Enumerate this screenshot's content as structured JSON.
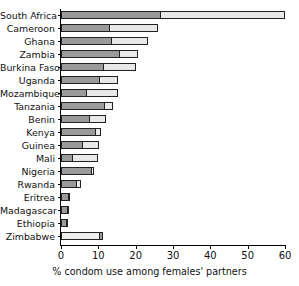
{
  "title_clipped": "condom use",
  "chart_data": {
    "type": "bar",
    "orientation": "horizontal",
    "stacked": true,
    "title": "",
    "xlabel": "% condom use among females' partners",
    "ylabel": "",
    "xlim": [
      0,
      60
    ],
    "xticks": [
      0,
      10,
      20,
      30,
      40,
      50,
      60
    ],
    "xticklabels": [
      "0",
      "10",
      "20",
      "30",
      "40",
      "50",
      "60"
    ],
    "grid": false,
    "legend": "none",
    "colors": {
      "segment_dark": "#9a9a9a",
      "segment_light": "#e8e8e8",
      "outline": "#222222",
      "background": "#ffffff"
    },
    "categories": [
      "South Africa",
      "Cameroon",
      "Ghana",
      "Zambia",
      "Burkina Faso",
      "Uganda",
      "Mozambique",
      "Tanzania",
      "Benin",
      "Kenya",
      "Guinea",
      "Mali",
      "Nigeria",
      "Rwanda",
      "Eritrea",
      "Madagascar",
      "Ethiopia",
      "Zimbabwe"
    ],
    "series": [
      {
        "name": "inner segment",
        "values": [
          26.3,
          12.6,
          13.2,
          15.3,
          11.0,
          10.0,
          6.5,
          11.3,
          7.3,
          8.9,
          5.4,
          2.7,
          7.9,
          3.7,
          1.6,
          1.4,
          1.0,
          10.0
        ]
      },
      {
        "name": "total",
        "values": [
          60.0,
          26.0,
          23.3,
          20.6,
          20.0,
          15.3,
          15.3,
          14.0,
          12.0,
          10.6,
          10.2,
          9.9,
          8.9,
          5.4,
          2.4,
          2.2,
          1.9,
          11.3
        ]
      }
    ],
    "zimbabwe_note": "light segment first, dark segment last"
  }
}
